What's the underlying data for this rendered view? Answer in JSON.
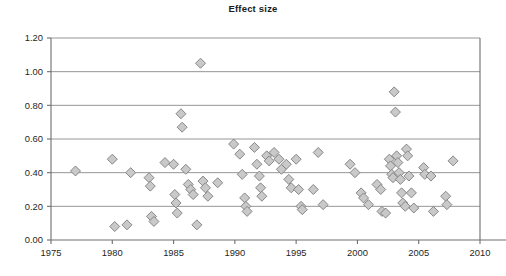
{
  "chart": {
    "title": "Effect size"
  },
  "chart_data": {
    "type": "scatter",
    "title": "Effect size",
    "xlabel": "",
    "ylabel": "",
    "xlim": [
      1975,
      2010
    ],
    "ylim": [
      0.0,
      1.2
    ],
    "grid": true,
    "grid_axis": "y",
    "legend": false,
    "marker": "diamond",
    "marker_fill": "#c9c9c9",
    "marker_edge": "#7d7d7d",
    "xticks": [
      1975,
      1980,
      1985,
      1990,
      1995,
      2000,
      2005,
      2010
    ],
    "xtick_labels": [
      "1975",
      "1980",
      "1985",
      "1990",
      "1995",
      "2000",
      "2005",
      "2010"
    ],
    "yticks": [
      0.0,
      0.2,
      0.4,
      0.6,
      0.8,
      1.0,
      1.2
    ],
    "ytick_labels": [
      "0.00",
      "0.20",
      "0.40",
      "0.60",
      "0.80",
      "1.00",
      "1.20"
    ],
    "points": [
      [
        1977.0,
        0.41
      ],
      [
        1980.0,
        0.48
      ],
      [
        1980.2,
        0.08
      ],
      [
        1981.2,
        0.09
      ],
      [
        1981.5,
        0.4
      ],
      [
        1983.0,
        0.37
      ],
      [
        1983.1,
        0.32
      ],
      [
        1983.2,
        0.14
      ],
      [
        1983.4,
        0.11
      ],
      [
        1984.3,
        0.46
      ],
      [
        1985.0,
        0.45
      ],
      [
        1985.1,
        0.27
      ],
      [
        1985.2,
        0.22
      ],
      [
        1985.3,
        0.16
      ],
      [
        1985.6,
        0.75
      ],
      [
        1985.7,
        0.67
      ],
      [
        1986.0,
        0.42
      ],
      [
        1986.2,
        0.33
      ],
      [
        1986.4,
        0.3
      ],
      [
        1986.6,
        0.27
      ],
      [
        1986.9,
        0.09
      ],
      [
        1987.2,
        1.05
      ],
      [
        1987.4,
        0.35
      ],
      [
        1987.6,
        0.31
      ],
      [
        1987.8,
        0.26
      ],
      [
        1988.6,
        0.34
      ],
      [
        1989.9,
        0.57
      ],
      [
        1990.4,
        0.51
      ],
      [
        1990.6,
        0.39
      ],
      [
        1990.8,
        0.25
      ],
      [
        1990.9,
        0.2
      ],
      [
        1991.0,
        0.17
      ],
      [
        1991.6,
        0.55
      ],
      [
        1991.8,
        0.45
      ],
      [
        1992.0,
        0.38
      ],
      [
        1992.1,
        0.31
      ],
      [
        1992.2,
        0.26
      ],
      [
        1992.6,
        0.5
      ],
      [
        1992.8,
        0.47
      ],
      [
        1993.2,
        0.52
      ],
      [
        1993.6,
        0.48
      ],
      [
        1993.8,
        0.42
      ],
      [
        1994.2,
        0.45
      ],
      [
        1994.4,
        0.36
      ],
      [
        1994.6,
        0.31
      ],
      [
        1995.0,
        0.48
      ],
      [
        1995.2,
        0.3
      ],
      [
        1995.4,
        0.2
      ],
      [
        1995.5,
        0.18
      ],
      [
        1996.4,
        0.3
      ],
      [
        1996.8,
        0.52
      ],
      [
        1997.2,
        0.21
      ],
      [
        1999.4,
        0.45
      ],
      [
        1999.8,
        0.4
      ],
      [
        2000.3,
        0.28
      ],
      [
        2000.5,
        0.25
      ],
      [
        2000.9,
        0.21
      ],
      [
        2001.6,
        0.33
      ],
      [
        2001.9,
        0.3
      ],
      [
        2002.0,
        0.17
      ],
      [
        2002.3,
        0.16
      ],
      [
        2002.6,
        0.48
      ],
      [
        2002.7,
        0.44
      ],
      [
        2002.8,
        0.39
      ],
      [
        2002.9,
        0.37
      ],
      [
        2003.0,
        0.88
      ],
      [
        2003.1,
        0.76
      ],
      [
        2003.2,
        0.5
      ],
      [
        2003.3,
        0.46
      ],
      [
        2003.4,
        0.4
      ],
      [
        2003.5,
        0.36
      ],
      [
        2003.6,
        0.28
      ],
      [
        2003.7,
        0.22
      ],
      [
        2003.9,
        0.2
      ],
      [
        2004.0,
        0.54
      ],
      [
        2004.1,
        0.5
      ],
      [
        2004.2,
        0.38
      ],
      [
        2004.4,
        0.28
      ],
      [
        2004.6,
        0.19
      ],
      [
        2005.4,
        0.43
      ],
      [
        2005.5,
        0.39
      ],
      [
        2006.0,
        0.38
      ],
      [
        2006.2,
        0.17
      ],
      [
        2007.2,
        0.26
      ],
      [
        2007.3,
        0.21
      ],
      [
        2007.8,
        0.47
      ]
    ]
  }
}
